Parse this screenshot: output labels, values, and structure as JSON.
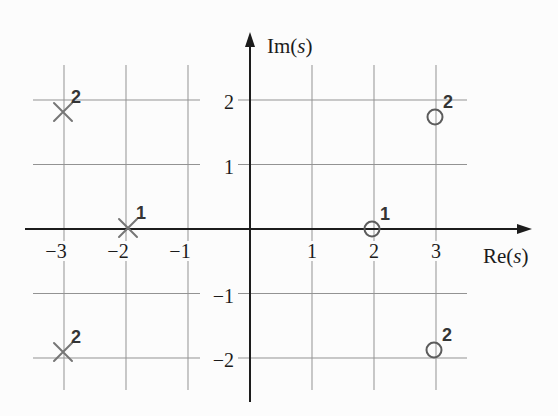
{
  "figure": {
    "background": "#fcfcfc",
    "axis_color": "#1c1c1c",
    "grid_color": "#939393",
    "pole_color": "#767676",
    "zero_color": "#5c5c5c",
    "tick_label_color": "#1b1b1b",
    "multiplicity_label_color": "#343434"
  },
  "chart_data": {
    "type": "scatter",
    "subtype": "pole-zero-plot",
    "title": "",
    "xlabel": "Re(s)",
    "ylabel": "Im(s)",
    "xlim": [
      -3.65,
      4.55
    ],
    "ylim": [
      -2.95,
      3.05
    ],
    "grid": true,
    "x_ticks": [
      -3,
      -2,
      -1,
      1,
      2,
      3
    ],
    "y_ticks": [
      2,
      1,
      -1,
      -2
    ],
    "series": [
      {
        "name": "poles",
        "marker": "x",
        "points": [
          {
            "re": -3,
            "im": 2,
            "multiplicity": 2
          },
          {
            "re": -2,
            "im": 0,
            "multiplicity": 1
          },
          {
            "re": -3,
            "im": -2,
            "multiplicity": 2
          }
        ]
      },
      {
        "name": "zeros",
        "marker": "o",
        "points": [
          {
            "re": 3,
            "im": 2,
            "multiplicity": 2
          },
          {
            "re": 2,
            "im": 0,
            "multiplicity": 1
          },
          {
            "re": 3,
            "im": -2,
            "multiplicity": 2
          }
        ]
      }
    ]
  }
}
